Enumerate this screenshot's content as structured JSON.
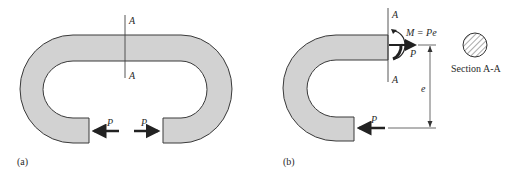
{
  "figure": {
    "panel_a": {
      "caption": "(a)",
      "section_label_top": "A",
      "section_label_bottom": "A",
      "force_left": "P",
      "force_right": "P"
    },
    "panel_b": {
      "caption": "(b)",
      "section_label_top": "A",
      "section_label_bottom": "A",
      "moment_label": "M = Pe",
      "force_top": "P",
      "force_bottom": "P",
      "eccentricity_label": "e"
    },
    "section_view": {
      "label": "Section A-A",
      "shape": "circle-hatched"
    },
    "colors": {
      "fill": "#d2d2d2",
      "stroke": "#3a3a3a",
      "text": "#2a2a2a"
    }
  }
}
